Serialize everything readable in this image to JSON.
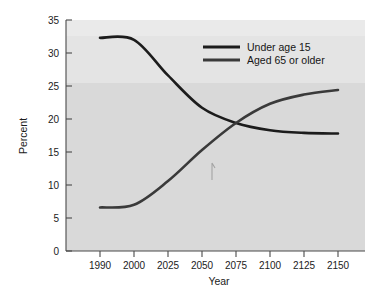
{
  "chart_data": {
    "type": "line",
    "title": "",
    "xlabel": "Year",
    "ylabel": "Percent",
    "grid": false,
    "legend_position": "top-right",
    "x": [
      1990,
      2000,
      2025,
      2050,
      2075,
      2100,
      2125,
      2150
    ],
    "x_tick_labels": [
      "1990",
      "2000",
      "2025",
      "2050",
      "2075",
      "2100",
      "2125",
      "2150"
    ],
    "y_tick_labels": [
      "0",
      "5",
      "10",
      "15",
      "20",
      "25",
      "30",
      "35"
    ],
    "y_ticks": [
      0,
      5,
      10,
      15,
      20,
      25,
      30,
      35
    ],
    "ylim": [
      0,
      35
    ],
    "axis_note": "x positions are evenly spaced categorical ticks",
    "series": [
      {
        "name": "Under age 15",
        "color": "#1c1c1c",
        "values": [
          32.3,
          32.0,
          26.6,
          21.7,
          19.4,
          18.3,
          17.9,
          17.8
        ]
      },
      {
        "name": "Aged 65 or older",
        "color": "#3a3a3a",
        "values": [
          6.6,
          7.0,
          10.6,
          15.3,
          19.4,
          22.3,
          23.7,
          24.4
        ]
      }
    ],
    "annotations": [
      {
        "name": "crossing-point",
        "x": 2072,
        "y": 19.2,
        "label": ""
      }
    ]
  },
  "legend": {
    "entries": [
      {
        "label": "Under age 15",
        "color": "#1c1c1c"
      },
      {
        "label": "Aged 65 or older",
        "color": "#3a3a3a"
      }
    ]
  },
  "axes": {
    "x_title": "Year",
    "y_title": "Percent",
    "x_labels": [
      "1990",
      "2000",
      "2025",
      "2050",
      "2075",
      "2100",
      "2125",
      "2150"
    ],
    "y_labels": [
      "35",
      "30",
      "25",
      "20",
      "15",
      "10",
      "5",
      "0"
    ]
  },
  "colors": {
    "plot_background": "#d9d9d9",
    "plot_background_upper": "#e4e4e4",
    "page_background": "#ffffff",
    "axis": "#4a4a4a",
    "text": "#1b1b1b"
  }
}
